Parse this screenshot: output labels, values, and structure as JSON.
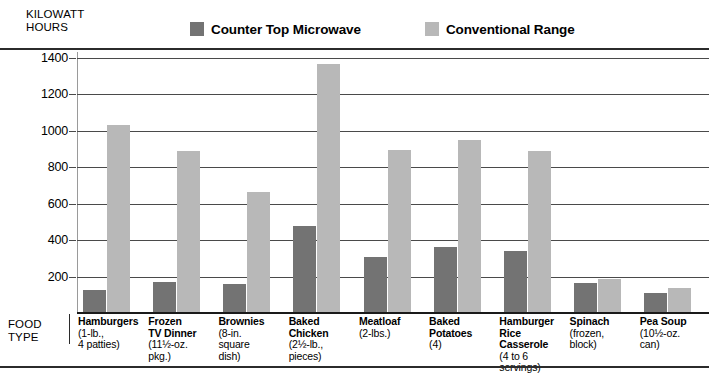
{
  "chart_data": {
    "type": "bar",
    "title": "",
    "ylabel": "KILOWATT HOURS",
    "xlabel": "FOOD TYPE",
    "ylim": [
      0,
      1400
    ],
    "yticks": [
      200,
      400,
      600,
      800,
      1000,
      1200,
      1400
    ],
    "grid": true,
    "legend_position": "top",
    "categories": [
      "Hamburgers",
      "Frozen TV Dinner",
      "Brownies",
      "Baked Chicken",
      "Meatloaf",
      "Baked Potatoes",
      "Hamburger Rice Casserole",
      "Spinach",
      "Pea Soup"
    ],
    "category_details": [
      "(1-lb., 4 patties)",
      "(11½-oz. pkg.)",
      "(8-in. square dish)",
      "(2½-lb., pieces)",
      "(2-lbs.)",
      "(4)",
      "(4 to 6 servings)",
      "(frozen, block)",
      "(10½-oz. can)"
    ],
    "series": [
      {
        "name": "Counter Top Microwave",
        "color": "#737373",
        "values": [
          125,
          170,
          160,
          480,
          310,
          360,
          340,
          165,
          110
        ]
      },
      {
        "name": "Conventional Range",
        "color": "#b8b8b8",
        "values": [
          1030,
          890,
          665,
          1365,
          895,
          950,
          890,
          185,
          135
        ]
      }
    ]
  },
  "axis": {
    "y_title_line1": "KILOWATT",
    "y_title_line2": "HOURS",
    "x_title_line1": "FOOD",
    "x_title_line2": "TYPE",
    "tick_labels": [
      "1400",
      "1200",
      "1000",
      "800",
      "600",
      "400",
      "200"
    ]
  },
  "legend": {
    "entries": [
      {
        "label": "Counter Top Microwave",
        "color": "#737373",
        "swatch_name": "legend-swatch-microwave"
      },
      {
        "label": "Conventional Range",
        "color": "#b8b8b8",
        "swatch_name": "legend-swatch-range"
      }
    ]
  },
  "categories_display": [
    {
      "name": "Hamburgers",
      "sub": "(1-lb.,\n4 patties)"
    },
    {
      "name": "Frozen\nTV Dinner",
      "sub": "(11½-oz.\npkg.)"
    },
    {
      "name": "Brownies",
      "sub": "(8-in.\nsquare\ndish)"
    },
    {
      "name": "Baked\nChicken",
      "sub": "(2½-lb.,\npieces)"
    },
    {
      "name": "Meatloaf",
      "sub": "(2-lbs.)"
    },
    {
      "name": "Baked\nPotatoes",
      "sub": "(4)"
    },
    {
      "name": "Hamburger\nRice\nCasserole",
      "sub": "(4 to 6\nservings)"
    },
    {
      "name": "Spinach",
      "sub": "(frozen,\nblock)"
    },
    {
      "name": "Pea Soup",
      "sub": "(10½-oz.\ncan)"
    }
  ]
}
